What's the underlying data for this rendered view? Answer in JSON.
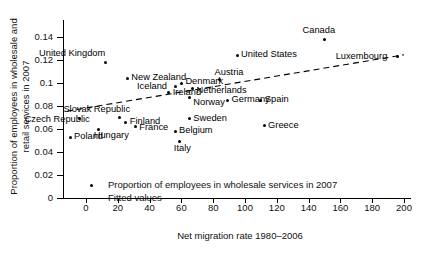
{
  "chart_data": {
    "type": "scatter",
    "title": "",
    "xlabel": "Net migration rate 1980–2006",
    "ylabel": "Proportion of employees in wholesale and retail services in 2007",
    "xlim": [
      -20,
      212
    ],
    "ylim": [
      0,
      0.152
    ],
    "xticks": [
      0,
      20,
      40,
      60,
      80,
      100,
      120,
      140,
      160,
      180,
      200
    ],
    "xtick_labels": [
      "0",
      "20",
      "40",
      "60",
      "80",
      "100",
      "120",
      "140",
      "160",
      "180",
      "200"
    ],
    "yticks": [
      0,
      0.02,
      0.04,
      0.06,
      0.08,
      0.1,
      0.12,
      0.14
    ],
    "ytick_labels": [
      "0",
      "0.02",
      "0.04",
      "0.06",
      "0.08",
      "0.1",
      "0.12",
      "0.14"
    ],
    "grid": false,
    "legend_position": "lower-left-inside",
    "legend": [
      {
        "marker": "dot",
        "label": "Proportion of employees in wholesale services in 2007"
      },
      {
        "marker": "dashed-line",
        "label": "Fitted values"
      }
    ],
    "points": [
      {
        "name": "Poland",
        "x": -10,
        "y": 0.053,
        "label_dx": 4,
        "label_dy": -5
      },
      {
        "name": "Czech Republic",
        "x": -4,
        "y": 0.069,
        "label_dx": -55,
        "label_dy": -4
      },
      {
        "name": "Hungary",
        "x": 8,
        "y": 0.06,
        "label_dx": -5,
        "label_dy": 2
      },
      {
        "name": "Slovak Republic",
        "x": 21,
        "y": 0.07,
        "label_dx": -56,
        "label_dy": -13
      },
      {
        "name": "Finland",
        "x": 25,
        "y": 0.066,
        "label_dx": 4,
        "label_dy": -5
      },
      {
        "name": "France",
        "x": 31,
        "y": 0.062,
        "label_dx": 4,
        "label_dy": -4
      },
      {
        "name": "United Kingdom",
        "x": 12,
        "y": 0.118,
        "label_dx": -66,
        "label_dy": -13
      },
      {
        "name": "New Zealand",
        "x": 26,
        "y": 0.104,
        "label_dx": 4,
        "label_dy": -5
      },
      {
        "name": "Iceland",
        "x": 56,
        "y": 0.097,
        "label_dx": -38,
        "label_dy": -4
      },
      {
        "name": "Denmark",
        "x": 60,
        "y": 0.1,
        "label_dx": 4,
        "label_dy": -6
      },
      {
        "name": "Ireland",
        "x": 52,
        "y": 0.092,
        "label_dx": 4,
        "label_dy": -4
      },
      {
        "name": "Netherlands",
        "x": 67,
        "y": 0.095,
        "label_dx": 4,
        "label_dy": -3
      },
      {
        "name": "Norway",
        "x": 65,
        "y": 0.087,
        "label_dx": 4,
        "label_dy": 0
      },
      {
        "name": "Austria",
        "x": 84,
        "y": 0.103,
        "label_dx": -5,
        "label_dy": -12
      },
      {
        "name": "Sweden",
        "x": 65,
        "y": 0.069,
        "label_dx": 4,
        "label_dy": -5
      },
      {
        "name": "Belgium",
        "x": 56,
        "y": 0.058,
        "label_dx": 4,
        "label_dy": -5
      },
      {
        "name": "Italy",
        "x": 59,
        "y": 0.049,
        "label_dx": -6,
        "label_dy": 2
      },
      {
        "name": "Germany",
        "x": 89,
        "y": 0.085,
        "label_dx": 4,
        "label_dy": -5
      },
      {
        "name": "Spain",
        "x": 110,
        "y": 0.085,
        "label_dx": 4,
        "label_dy": -5
      },
      {
        "name": "Greece",
        "x": 112,
        "y": 0.063,
        "label_dx": 4,
        "label_dy": -5
      },
      {
        "name": "United States",
        "x": 95,
        "y": 0.124,
        "label_dx": 4,
        "label_dy": -5
      },
      {
        "name": "Canada",
        "x": 150,
        "y": 0.138,
        "label_dx": -22,
        "label_dy": -13
      },
      {
        "name": "Luxembourg",
        "x": 196,
        "y": 0.123,
        "label_dx": -62,
        "label_dy": -5
      }
    ],
    "fitted_line": {
      "x0": -12,
      "y0": 0.0755,
      "x1": 200,
      "y1": 0.1245,
      "style": "dashed"
    }
  }
}
